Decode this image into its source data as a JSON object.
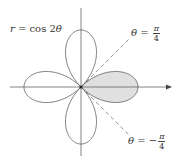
{
  "figure": {
    "equation": {
      "lhs": "r",
      "eq": " = cos 2",
      "var": "θ"
    },
    "line_upper": {
      "var": "θ",
      "eq": " = ",
      "sign": "",
      "num": "π",
      "den": "4"
    },
    "line_lower": {
      "var": "θ",
      "eq": " = ",
      "sign": "−",
      "num": "π",
      "den": "4"
    },
    "colors": {
      "curve": "#555555",
      "axis": "#666666",
      "shade": "#e0e0e0",
      "dashed": "#777777"
    },
    "shaded_region": "right petal, −π/4 ≤ θ ≤ π/4"
  }
}
